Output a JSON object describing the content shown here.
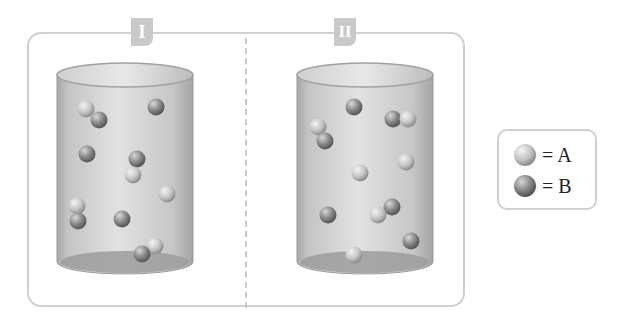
{
  "containers": [
    {
      "label": "I",
      "particles": [
        {
          "x": 86,
          "y": 109,
          "type": "A"
        },
        {
          "x": 99,
          "y": 120,
          "type": "B"
        },
        {
          "x": 156,
          "y": 107,
          "type": "B"
        },
        {
          "x": 87,
          "y": 154,
          "type": "B"
        },
        {
          "x": 137,
          "y": 159,
          "type": "B"
        },
        {
          "x": 133,
          "y": 175,
          "type": "A"
        },
        {
          "x": 167,
          "y": 194,
          "type": "A"
        },
        {
          "x": 77,
          "y": 206,
          "type": "A"
        },
        {
          "x": 78,
          "y": 221,
          "type": "B"
        },
        {
          "x": 122,
          "y": 219,
          "type": "B"
        },
        {
          "x": 155,
          "y": 246,
          "type": "A"
        },
        {
          "x": 142,
          "y": 254,
          "type": "B"
        }
      ]
    },
    {
      "label": "II",
      "particles": [
        {
          "x": 354,
          "y": 107,
          "type": "B"
        },
        {
          "x": 318,
          "y": 127,
          "type": "A"
        },
        {
          "x": 325,
          "y": 141,
          "type": "B"
        },
        {
          "x": 393,
          "y": 119,
          "type": "B"
        },
        {
          "x": 408,
          "y": 119,
          "type": "A"
        },
        {
          "x": 406,
          "y": 162,
          "type": "A"
        },
        {
          "x": 360,
          "y": 173,
          "type": "A"
        },
        {
          "x": 328,
          "y": 215,
          "type": "B"
        },
        {
          "x": 392,
          "y": 207,
          "type": "B"
        },
        {
          "x": 378,
          "y": 215,
          "type": "A"
        },
        {
          "x": 411,
          "y": 241,
          "type": "B"
        },
        {
          "x": 354,
          "y": 255,
          "type": "A"
        }
      ]
    }
  ],
  "legend": [
    {
      "type": "A",
      "label": "= A"
    },
    {
      "type": "B",
      "label": "= B"
    }
  ],
  "colors": {
    "frame_border": "#d0d0d0",
    "label_tag": "#c9c9c9",
    "cylinder_body": "#c8c8c8",
    "particle_A": "#c4c4c4",
    "particle_B": "#8a8a8a"
  }
}
